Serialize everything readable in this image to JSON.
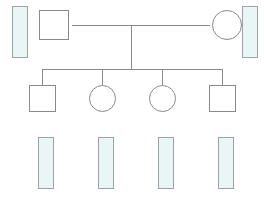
{
  "diagram": {
    "colors": {
      "line": "#8a8a8a",
      "gel_border": "#9aa3a8",
      "gel_fill": "#eaf6f6",
      "highlight_border": "#3d8f63",
      "highlight_fill": "#e4f4ec",
      "band_pink": "#c98f9c",
      "band_blue": "#8f93ab"
    }
  },
  "scale": {
    "labels": [
      "7",
      "6",
      "5",
      "4",
      "3",
      "2"
    ],
    "top_value": 7,
    "bottom_value": 2
  },
  "generation1": {
    "individuals": [
      {
        "id": "I-1",
        "sex": "male",
        "shape": "square"
      },
      {
        "id": "I-2",
        "sex": "female",
        "shape": "circle"
      }
    ]
  },
  "generation2": {
    "individuals": [
      {
        "id": "II-1",
        "sex": "male",
        "shape": "square"
      },
      {
        "id": "II-2",
        "sex": "female",
        "shape": "circle"
      },
      {
        "id": "II-3",
        "sex": "female",
        "shape": "circle"
      },
      {
        "id": "II-4",
        "sex": "male",
        "shape": "square"
      }
    ]
  },
  "gels": [
    {
      "id": "gel-father",
      "owner": "I-1",
      "highlighted": false,
      "labels": [
        "7",
        "6",
        "5",
        "4",
        "3",
        "2"
      ],
      "bands": [
        {
          "position": 6,
          "color": "pink"
        },
        {
          "position": 4,
          "color": "blue"
        }
      ]
    },
    {
      "id": "gel-mother",
      "owner": "I-2",
      "highlighted": false,
      "labels": [
        "7",
        "6",
        "5",
        "4",
        "3",
        "2"
      ],
      "bands": [
        {
          "position": 5,
          "color": "pink"
        },
        {
          "position": 3,
          "color": "pink"
        }
      ]
    },
    {
      "id": "gel-child-1",
      "owner": "II-1",
      "highlighted": false,
      "labels": [
        "7",
        "6",
        "5",
        "4",
        "3",
        "2"
      ],
      "bands": [
        {
          "position": 6,
          "color": "blue"
        },
        {
          "position": 5,
          "color": "pink"
        }
      ]
    },
    {
      "id": "gel-child-2",
      "owner": "II-2",
      "highlighted": false,
      "labels": [
        "7",
        "6",
        "5",
        "4",
        "3",
        "2"
      ],
      "bands": [
        {
          "position": 5,
          "color": "pink"
        },
        {
          "position": 4,
          "color": "blue"
        }
      ]
    },
    {
      "id": "gel-child-3",
      "owner": "II-3",
      "highlighted": false,
      "labels": [
        "7",
        "6",
        "5",
        "4",
        "3",
        "2"
      ],
      "bands": [
        {
          "position": 4,
          "color": "blue"
        },
        {
          "position": 3,
          "color": "pink"
        }
      ]
    },
    {
      "id": "gel-child-4",
      "owner": "II-4",
      "highlighted": true,
      "labels": [
        "7",
        "6",
        "5",
        "4",
        "3",
        "2"
      ],
      "bands": []
    }
  ]
}
